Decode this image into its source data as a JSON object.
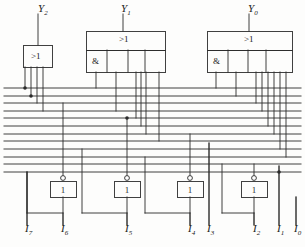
{
  "diagram": {
    "stroke_color": "#2b2b2b",
    "background": "#fdfdfc",
    "width": 305,
    "height": 247
  },
  "outputs": [
    {
      "name": "Y2",
      "base": "Y",
      "sub": "2",
      "x": 38,
      "y": 8,
      "stem_x": 38,
      "stem_y0": 14,
      "stem_y1": 45
    },
    {
      "name": "Y1",
      "base": "Y",
      "sub": "1",
      "x": 121,
      "y": 8,
      "stem_x": 123,
      "stem_y0": 14,
      "stem_y1": 31
    },
    {
      "name": "Y0",
      "base": "Y",
      "sub": "0",
      "x": 248,
      "y": 8,
      "stem_x": 249,
      "stem_y0": 14,
      "stem_y1": 31
    }
  ],
  "gates": [
    {
      "id": "y2-or",
      "symbol": ">1",
      "type": "or",
      "box": {
        "x": 23,
        "y": 45,
        "w": 29,
        "h": 22
      },
      "symbol_pos": {
        "x": 31,
        "y": 51
      },
      "input_stems": [
        25,
        31,
        37,
        43
      ],
      "and_cells": []
    },
    {
      "id": "y1-or",
      "symbol": ">1",
      "type": "or-with-and-row",
      "box": {
        "x": 86,
        "y": 31,
        "w": 79,
        "h": 19
      },
      "symbol_pos": {
        "x": 119,
        "y": 34
      },
      "and_row": {
        "x": 86,
        "y": 50,
        "w": 79,
        "h": 22
      },
      "and_symbol": "&",
      "and_symbol_pos": {
        "x": 92,
        "y": 56
      },
      "and_dividers": [
        107,
        128,
        145
      ],
      "input_stems": [
        96,
        116,
        136,
        141,
        146,
        159
      ]
    },
    {
      "id": "y0-or",
      "symbol": ">1",
      "type": "or-with-and-row",
      "box": {
        "x": 207,
        "y": 31,
        "w": 85,
        "h": 19
      },
      "symbol_pos": {
        "x": 244,
        "y": 34
      },
      "and_row": {
        "x": 207,
        "y": 50,
        "w": 85,
        "h": 22
      },
      "and_symbol": "&",
      "and_symbol_pos": {
        "x": 213,
        "y": 56
      },
      "and_dividers": [
        228,
        248,
        266
      ],
      "input_stems": [
        216,
        236,
        256,
        262,
        268,
        274,
        280,
        286
      ]
    }
  ],
  "inverters": [
    {
      "id": "inv-i6",
      "symbol": "1",
      "box": {
        "x": 50,
        "y": 181,
        "w": 26,
        "h": 16
      },
      "bubble": {
        "cx": 63,
        "cy": 178,
        "r": 2.4
      },
      "in_x": 63,
      "out_x": 63,
      "out_y": 213,
      "feed_x": 27,
      "feed_y": 213
    },
    {
      "id": "inv-i5",
      "symbol": "1",
      "box": {
        "x": 114,
        "y": 181,
        "w": 26,
        "h": 16
      },
      "bubble": {
        "cx": 127,
        "cy": 178,
        "r": 2.4
      },
      "in_x": 127,
      "out_x": 127,
      "out_y": 213,
      "feed_x": 82,
      "feed_y": 213
    },
    {
      "id": "inv-i4",
      "symbol": "1",
      "box": {
        "x": 177,
        "y": 181,
        "w": 26,
        "h": 16
      },
      "bubble": {
        "cx": 190,
        "cy": 178,
        "r": 2.4
      },
      "in_x": 190,
      "out_x": 190,
      "out_y": 213,
      "feed_x": 145,
      "feed_y": 213
    },
    {
      "id": "inv-i2",
      "symbol": "1",
      "box": {
        "x": 241,
        "y": 181,
        "w": 26,
        "h": 16
      },
      "bubble": {
        "cx": 254,
        "cy": 178,
        "r": 2.4
      },
      "in_x": 254,
      "out_x": 254,
      "out_y": 213,
      "feed_x": 222,
      "feed_y": 213
    }
  ],
  "inputs": [
    {
      "name": "I7",
      "base": "I",
      "sub": "7",
      "x": 25,
      "y": 228,
      "line_x": 27,
      "line_y0": 172,
      "line_y1": 225
    },
    {
      "name": "I6",
      "base": "I",
      "sub": "6",
      "x": 61,
      "y": 228,
      "line_x": 63,
      "line_y0": 213,
      "line_y1": 225
    },
    {
      "name": "I5",
      "base": "I",
      "sub": "5",
      "x": 125,
      "y": 228,
      "line_x": 127,
      "line_y0": 213,
      "line_y1": 225
    },
    {
      "name": "I4",
      "base": "I",
      "sub": "4",
      "x": 188,
      "y": 228,
      "line_x": 190,
      "line_y0": 213,
      "line_y1": 225
    },
    {
      "name": "I3",
      "base": "I",
      "sub": "3",
      "x": 207,
      "y": 228,
      "line_x": 209,
      "line_y0": 143,
      "line_y1": 225
    },
    {
      "name": "I2",
      "base": "I",
      "sub": "2",
      "x": 253,
      "y": 228,
      "line_x": 254,
      "line_y0": 213,
      "line_y1": 225
    },
    {
      "name": "I1",
      "base": "I",
      "sub": "1",
      "x": 277,
      "y": 228,
      "line_x": 279,
      "line_y0": 166,
      "line_y1": 225
    },
    {
      "name": "I0",
      "base": "I",
      "sub": "0",
      "x": 294,
      "y": 228,
      "line_x": 296,
      "line_y0": 197,
      "line_y1": 225
    }
  ],
  "bus_lines": {
    "count": 12,
    "x_start": 4,
    "x_end": 301,
    "y_values": [
      88,
      96,
      103,
      111,
      118,
      126,
      134,
      141,
      149,
      157,
      164,
      172
    ]
  },
  "junction_dots": [
    {
      "x": 25,
      "y": 88
    },
    {
      "x": 31,
      "y": 96
    },
    {
      "x": 127,
      "y": 118
    },
    {
      "x": 279,
      "y": 172
    }
  ],
  "vertical_drops": [
    {
      "id": "y2-in-0",
      "x": 25,
      "y0": 67,
      "y1": 88
    },
    {
      "id": "y2-in-1",
      "x": 31,
      "y0": 67,
      "y1": 96
    },
    {
      "id": "y2-in-2",
      "x": 37,
      "y0": 67,
      "y1": 103
    },
    {
      "id": "y2-in-3",
      "x": 43,
      "y0": 67,
      "y1": 111
    },
    {
      "id": "y1-in-0",
      "x": 96,
      "y0": 72,
      "y1": 88
    },
    {
      "id": "y1-in-1",
      "x": 116,
      "y0": 72,
      "y1": 111
    },
    {
      "id": "y1-in-2",
      "x": 136,
      "y0": 72,
      "y1": 118
    },
    {
      "id": "y1-in-3",
      "x": 141,
      "y0": 72,
      "y1": 126
    },
    {
      "id": "y1-in-4",
      "x": 146,
      "y0": 72,
      "y1": 134
    },
    {
      "id": "y1-in-5",
      "x": 159,
      "y0": 72,
      "y1": 141
    },
    {
      "id": "y0-in-0",
      "x": 216,
      "y0": 72,
      "y1": 88
    },
    {
      "id": "y0-in-1",
      "x": 236,
      "y0": 72,
      "y1": 96
    },
    {
      "id": "y0-in-2",
      "x": 256,
      "y0": 72,
      "y1": 103
    },
    {
      "id": "y0-in-3",
      "x": 262,
      "y0": 72,
      "y1": 111
    },
    {
      "id": "y0-in-4",
      "x": 268,
      "y0": 72,
      "y1": 126
    },
    {
      "id": "y0-in-5",
      "x": 274,
      "y0": 72,
      "y1": 134
    },
    {
      "id": "y0-in-6",
      "x": 280,
      "y0": 72,
      "y1": 149
    },
    {
      "id": "y0-in-7",
      "x": 286,
      "y0": 72,
      "y1": 157
    },
    {
      "id": "inv-i6-in",
      "x": 63,
      "y0": 103,
      "y1": 176
    },
    {
      "id": "inv-i5-in",
      "x": 127,
      "y0": 118,
      "y1": 176
    },
    {
      "id": "inv-i4-in",
      "x": 190,
      "y0": 134,
      "y1": 176
    },
    {
      "id": "inv-i2-in",
      "x": 254,
      "y0": 164,
      "y1": 176
    },
    {
      "id": "i7-riser",
      "x": 27,
      "y0": 172,
      "y1": 225
    },
    {
      "id": "i3-riser",
      "x": 209,
      "y0": 143,
      "y1": 225
    },
    {
      "id": "i1-riser",
      "x": 279,
      "y0": 166,
      "y1": 225
    },
    {
      "id": "i0-riser",
      "x": 296,
      "y0": 197,
      "y1": 225
    },
    {
      "id": "i6-drop",
      "x": 63,
      "y0": 197,
      "y1": 225
    },
    {
      "id": "i5-drop",
      "x": 127,
      "y0": 197,
      "y1": 225
    },
    {
      "id": "i4-drop",
      "x": 190,
      "y0": 197,
      "y1": 225
    },
    {
      "id": "i2-drop",
      "x": 254,
      "y0": 197,
      "y1": 225
    }
  ],
  "feedback_paths": [
    {
      "id": "fb-i6",
      "x0": 27,
      "x1": 63,
      "y": 213,
      "up_x": 27,
      "up_y": 172
    },
    {
      "id": "fb-i5",
      "x0": 82,
      "x1": 127,
      "y": 213,
      "up_x": 82,
      "up_y": 149
    },
    {
      "id": "fb-i4",
      "x0": 145,
      "x1": 190,
      "y": 213,
      "up_x": 145,
      "up_y": 157
    },
    {
      "id": "fb-i2",
      "x0": 222,
      "x1": 254,
      "y": 213,
      "up_x": 222,
      "up_y": 164
    }
  ]
}
